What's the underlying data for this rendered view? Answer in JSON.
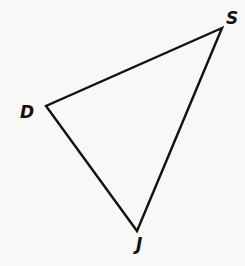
{
  "diagram": {
    "type": "triangle",
    "name": "Triangle DSJ",
    "stroke_color": "#111111",
    "background_color": "#f8f8f7",
    "vertices": [
      {
        "label": "S",
        "x": 222,
        "y": 28,
        "label_x": 226,
        "label_y": 24
      },
      {
        "label": "D",
        "x": 46,
        "y": 106,
        "label_x": 20,
        "label_y": 118
      },
      {
        "label": "J",
        "x": 137,
        "y": 231,
        "label_x": 136,
        "label_y": 250
      }
    ],
    "edges": [
      {
        "from": "D",
        "to": "S"
      },
      {
        "from": "S",
        "to": "J"
      },
      {
        "from": "J",
        "to": "D"
      }
    ]
  }
}
